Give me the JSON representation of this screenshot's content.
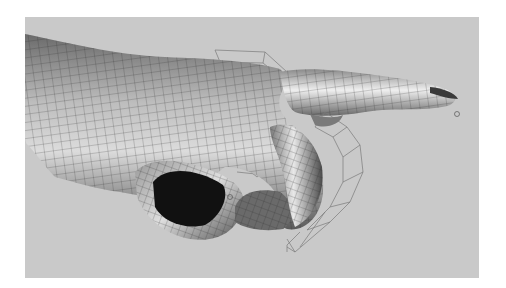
{
  "scene": {
    "subject": "3D hand model pointing with index finger",
    "style": "smooth-shaded polygon mesh with wireframe overlay",
    "overlay": "wireframe control cages around curled middle/ring/little fingers",
    "colors": {
      "page_background": "#ffffff",
      "viewport_background": "#c9c9c9",
      "mesh_light": "#e6e6e6",
      "mesh_mid": "#9a9a9a",
      "mesh_dark": "#3a3a3a",
      "wire": "#2a2a2a",
      "cage": "#7a7a7a",
      "sleeve_interior": "#111111"
    }
  }
}
